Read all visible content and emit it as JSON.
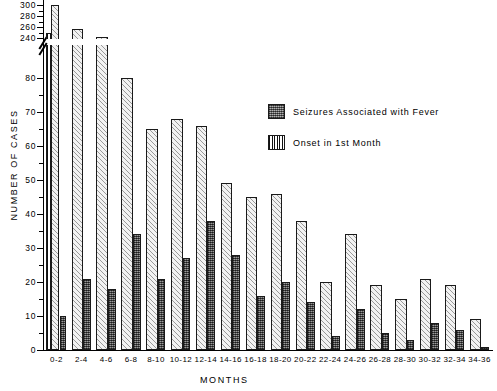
{
  "chart_data": {
    "type": "bar",
    "title": "",
    "xlabel": "MONTHS",
    "ylabel": "NUMBER OF CASES",
    "grid": false,
    "legend_position": "inside-upper-right",
    "axis_break": {
      "lower_max": 80,
      "upper_min": 240,
      "note": "y-axis broken between 80 and 240"
    },
    "ylim_lower": [
      0,
      80
    ],
    "ylim_upper": [
      240,
      300
    ],
    "ytick_labels_lower": [
      "0",
      "10",
      "20",
      "30",
      "40",
      "50",
      "60",
      "70",
      "80"
    ],
    "ytick_labels_upper": [
      "240",
      "260",
      "280",
      "300"
    ],
    "categories": [
      "0-2",
      "2-4",
      "4-6",
      "6-8",
      "8-10",
      "10-12",
      "12-14",
      "14-16",
      "16-18",
      "18-20",
      "20-22",
      "22-24",
      "24-26",
      "26-28",
      "28-30",
      "30-32",
      "32-34",
      "34-36"
    ],
    "series": [
      {
        "name": "Total cases",
        "key": "total",
        "values": [
          300,
          256,
          241,
          80,
          65,
          68,
          66,
          49,
          45,
          46,
          38,
          20,
          34,
          19,
          15,
          21,
          19,
          9
        ]
      },
      {
        "name": "Seizures Associated with Fever",
        "key": "fever",
        "values": [
          10,
          21,
          18,
          34,
          21,
          27,
          38,
          28,
          16,
          20,
          14,
          4,
          12,
          5,
          3,
          8,
          6,
          1
        ]
      },
      {
        "name": "Onset in 1st Month",
        "key": "onset",
        "values": [
          241,
          null,
          null,
          null,
          null,
          null,
          null,
          null,
          null,
          null,
          null,
          null,
          null,
          null,
          null,
          null,
          null,
          null
        ]
      }
    ]
  },
  "legend": {
    "items": [
      {
        "label": "Seizures Associated with Fever",
        "swatch": "fever"
      },
      {
        "label": "Onset in 1st Month",
        "swatch": "onset"
      }
    ]
  },
  "axis": {
    "y_title": "NUMBER OF CASES",
    "x_title": "MONTHS"
  }
}
